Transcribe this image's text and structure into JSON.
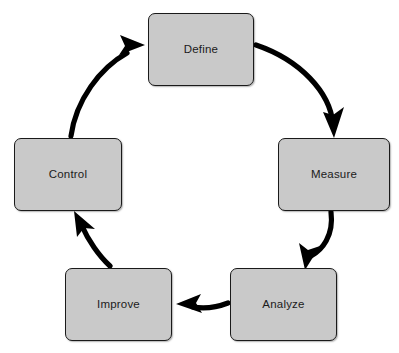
{
  "diagram": {
    "type": "cycle",
    "direction": "clockwise",
    "background_color": "#ffffff",
    "node_fill_color": "#c9c9c9",
    "node_border_color": "#1a1a1a",
    "arrow_color": "#000000",
    "nodes": [
      {
        "id": "define",
        "label": "Define",
        "position": "top"
      },
      {
        "id": "measure",
        "label": "Measure",
        "position": "right"
      },
      {
        "id": "analyze",
        "label": "Analyze",
        "position": "bottom-right"
      },
      {
        "id": "improve",
        "label": "Improve",
        "position": "bottom-left"
      },
      {
        "id": "control",
        "label": "Control",
        "position": "left"
      }
    ],
    "edges": [
      {
        "id": "define-to-measure",
        "from": "Define",
        "to": "Measure",
        "style": "curved-arrow"
      },
      {
        "id": "measure-to-analyze",
        "from": "Measure",
        "to": "Analyze",
        "style": "curved-arrow"
      },
      {
        "id": "analyze-to-improve",
        "from": "Analyze",
        "to": "Improve",
        "style": "curved-arrow"
      },
      {
        "id": "improve-to-control",
        "from": "Improve",
        "to": "Control",
        "style": "curved-arrow"
      },
      {
        "id": "control-to-define",
        "from": "Control",
        "to": "Define",
        "style": "curved-arrow"
      }
    ]
  }
}
